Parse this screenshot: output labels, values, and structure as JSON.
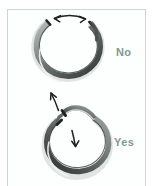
{
  "figure": {
    "medium": "hand-drawn pencil sketch",
    "background_color": "#ffffff",
    "frame_color": "#c8d6d5",
    "ink_color": "#2b2b2b",
    "label_color": "#7f9a94"
  },
  "panels": [
    {
      "id": "panel-no",
      "label": "No",
      "ring": {
        "shape": "open-jump-ring",
        "gap_position": "top",
        "gap_opened": "ends pulled apart sideways in the ring plane"
      },
      "annotation": {
        "type": "double-headed-curved-arrow",
        "direction": "left-right",
        "position": "above the gap",
        "meaning": "pulling the ends apart widens and distorts the ring"
      }
    },
    {
      "id": "panel-yes",
      "label": "Yes",
      "ring": {
        "shape": "open-jump-ring",
        "gap_position": "top",
        "gap_opened": "ends twisted out of plane, one forward one back"
      },
      "annotations": [
        {
          "type": "single-headed-arrow",
          "direction": "up",
          "position": "outside upper-left of the ring",
          "meaning": "twist the far end toward you / upward"
        },
        {
          "type": "single-headed-arrow",
          "direction": "down",
          "position": "inside the ring, right of center",
          "meaning": "twist the near end away / downward"
        }
      ]
    }
  ],
  "labels": {
    "no": "No",
    "yes": "Yes"
  }
}
